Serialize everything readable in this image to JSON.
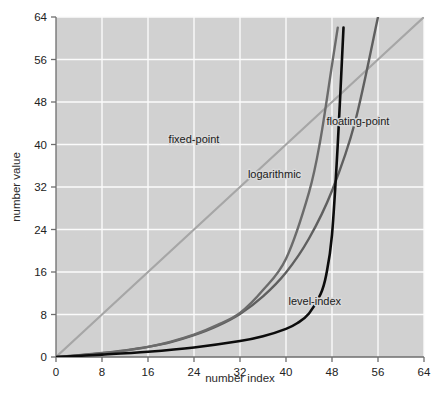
{
  "chart_data": {
    "type": "line",
    "title": "",
    "xlabel": "number index",
    "ylabel": "number value",
    "xlim": [
      0,
      64
    ],
    "ylim": [
      0,
      64
    ],
    "xticks": [
      0,
      8,
      16,
      24,
      32,
      40,
      48,
      56,
      64
    ],
    "yticks": [
      0,
      8,
      16,
      24,
      32,
      40,
      48,
      56,
      64
    ],
    "xtick_labels": [
      "0",
      "8",
      "16",
      "24",
      "32",
      "40",
      "48",
      "56",
      "64"
    ],
    "ytick_labels": [
      "0",
      "8",
      "16",
      "24",
      "32",
      "40",
      "48",
      "56",
      "64"
    ],
    "grid": true,
    "legend_position": "inline-annotations",
    "background_color": "#d8d8d8",
    "gridline_color": "#fbfbfb",
    "series": [
      {
        "name": "fixed-point",
        "color": "#a6a6a6",
        "line_width": 2.2,
        "label": "fixed-point",
        "label_x": 24.0,
        "label_y": 41.0,
        "x": [
          0,
          8,
          16,
          24,
          32,
          40,
          48,
          56,
          64
        ],
        "values": [
          0,
          8,
          16,
          24,
          32,
          40,
          48,
          56,
          64
        ]
      },
      {
        "name": "floating-point",
        "color": "#5f5f5f",
        "line_width": 2.4,
        "label": "floating-point",
        "label_x": 52.5,
        "label_y": 44.5,
        "x": [
          0,
          4,
          8,
          12,
          16,
          20,
          24,
          28,
          32,
          36,
          40,
          44,
          48,
          52,
          56
        ],
        "values": [
          0.0,
          0.35,
          0.75,
          1.25,
          1.9,
          2.8,
          4.1,
          5.8,
          8.1,
          11.4,
          15.9,
          22.3,
          31.3,
          44.2,
          64.0
        ]
      },
      {
        "name": "logarithmic",
        "color": "#6b6b6b",
        "line_width": 2.4,
        "label": "logarithmic",
        "label_x": 38.0,
        "label_y": 34.5,
        "x": [
          0,
          4,
          8,
          12,
          16,
          20,
          24,
          28,
          32,
          36,
          40,
          44,
          46,
          48,
          49
        ],
        "values": [
          0.0,
          0.3,
          0.7,
          1.2,
          1.9,
          2.9,
          4.2,
          6.0,
          8.3,
          12.6,
          18.5,
          31.0,
          41.0,
          55.0,
          62.0
        ]
      },
      {
        "name": "level-index",
        "color": "#0c0c0c",
        "line_width": 2.6,
        "label": "level-index",
        "label_x": 45.0,
        "label_y": 10.5,
        "x": [
          0,
          8,
          16,
          24,
          32,
          36,
          40,
          42,
          44,
          46,
          47,
          48,
          49,
          50
        ],
        "values": [
          0.0,
          0.45,
          1.0,
          1.8,
          3.0,
          3.9,
          5.3,
          6.4,
          8.2,
          11.8,
          15.5,
          23.0,
          40.0,
          62.0
        ]
      }
    ]
  },
  "axes": {
    "x_title": "number index",
    "y_title": "number value"
  }
}
